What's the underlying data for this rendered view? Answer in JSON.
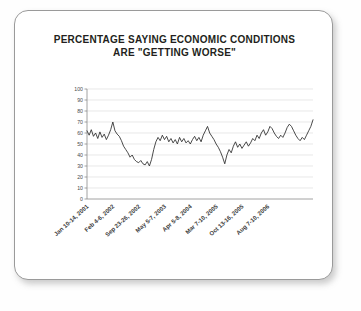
{
  "card": {
    "background": "#ffffff",
    "border_color": "#9a9a9a"
  },
  "chart_data": {
    "type": "line",
    "title": "PERCENTAGE SAYING ECONOMIC CONDITIONS ARE \"GETTING WORSE\"",
    "title_line1": "PERCENTAGE SAYING ECONOMIC CONDITIONS",
    "title_line2": "ARE \"GETTING WORSE\"",
    "xlabel": "",
    "ylabel": "",
    "ylim": [
      0,
      100
    ],
    "ytick_labels": [
      "100",
      "90",
      "80",
      "70",
      "60",
      "50",
      "40",
      "30",
      "20",
      "10",
      "0"
    ],
    "ytick_values": [
      100,
      90,
      80,
      70,
      60,
      50,
      40,
      30,
      20,
      10,
      0
    ],
    "grid": true,
    "legend": false,
    "line_color": "#2b2b2b",
    "xtick_labels": [
      "Jan 10-14, 2001",
      "Feb 4-6, 2002",
      "Sep 23-26, 2002",
      "May 5-7, 2003",
      "Apr 5-8, 2004",
      "Mar 7-10, 2005",
      "Oct 13-16, 2005",
      "Aug 7-10, 2006"
    ],
    "xtick_positions": [
      0,
      14,
      28,
      42,
      56,
      70,
      84,
      98
    ],
    "series": [
      {
        "name": "Getting worse",
        "values": [
          62,
          58,
          63,
          57,
          60,
          55,
          61,
          56,
          59,
          54,
          58,
          63,
          70,
          62,
          59,
          57,
          53,
          48,
          45,
          42,
          38,
          40,
          36,
          34,
          33,
          35,
          32,
          31,
          34,
          30,
          36,
          45,
          52,
          56,
          53,
          58,
          54,
          57,
          52,
          55,
          51,
          54,
          50,
          56,
          52,
          55,
          51,
          53,
          50,
          54,
          57,
          53,
          56,
          52,
          58,
          62,
          66,
          60,
          57,
          54,
          50,
          47,
          43,
          38,
          32,
          40,
          45,
          42,
          48,
          52,
          47,
          50,
          46,
          49,
          52,
          48,
          51,
          55,
          53,
          58,
          55,
          60,
          63,
          58,
          61,
          66,
          64,
          60,
          57,
          55,
          58,
          56,
          60,
          65,
          68,
          66,
          62,
          58,
          55,
          53,
          56,
          54,
          58,
          62,
          66,
          72
        ]
      }
    ]
  }
}
